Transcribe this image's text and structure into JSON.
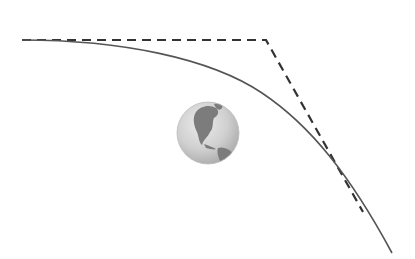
{
  "diagram": {
    "type": "orbital-trajectory",
    "colors": {
      "background": "#ffffff",
      "curve": "#555555",
      "dashed_path": "#333333",
      "earth_ocean": "#c8c8c8",
      "earth_land": "#7a7a7a"
    },
    "elements": {
      "earth": {
        "label": "Earth",
        "cx": 208,
        "cy": 133,
        "r": 31
      },
      "curved_path": {
        "label": "curved trajectory",
        "style": "solid"
      },
      "tangent_path": {
        "label": "straight-line path",
        "style": "dashed"
      }
    }
  }
}
